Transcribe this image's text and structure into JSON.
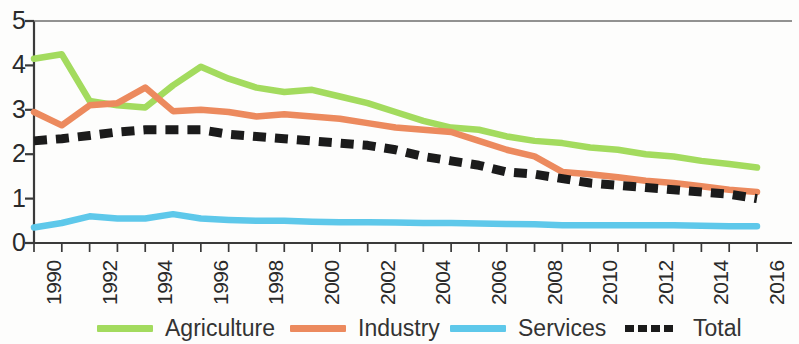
{
  "chart_data": {
    "type": "line",
    "title": "",
    "subtitle": "",
    "xlabel": "",
    "ylabel": "",
    "x": [
      1990,
      1991,
      1992,
      1993,
      1994,
      1995,
      1996,
      1997,
      1998,
      1999,
      2000,
      2001,
      2002,
      2003,
      2004,
      2005,
      2006,
      2007,
      2008,
      2009,
      2010,
      2011,
      2012,
      2013,
      2014,
      2015,
      2016
    ],
    "xlim": [
      1990,
      2016
    ],
    "ylim": [
      0,
      5
    ],
    "y_ticks": [
      "0",
      "1",
      "2",
      "3",
      "4",
      "5"
    ],
    "x_ticks": [
      "1990",
      "1992",
      "1994",
      "1996",
      "1998",
      "2000",
      "2002",
      "2004",
      "2006",
      "2008",
      "2010",
      "2012",
      "2014",
      "2016"
    ],
    "grid": false,
    "legend_position": "bottom",
    "series": [
      {
        "name": "Agriculture",
        "color": "#a3db5e",
        "style": "solid",
        "values": [
          4.15,
          4.25,
          3.2,
          3.1,
          3.05,
          3.55,
          3.97,
          3.7,
          3.5,
          3.4,
          3.45,
          3.3,
          3.15,
          2.95,
          2.75,
          2.6,
          2.55,
          2.4,
          2.3,
          2.25,
          2.15,
          2.1,
          2.0,
          1.95,
          1.85,
          1.78,
          1.7
        ]
      },
      {
        "name": "Industry",
        "color": "#ec8a5e",
        "style": "solid",
        "values": [
          2.95,
          2.65,
          3.1,
          3.15,
          3.5,
          2.97,
          3.0,
          2.95,
          2.85,
          2.9,
          2.85,
          2.8,
          2.7,
          2.6,
          2.55,
          2.5,
          2.3,
          2.1,
          1.95,
          1.6,
          1.55,
          1.48,
          1.4,
          1.35,
          1.28,
          1.2,
          1.15
        ]
      },
      {
        "name": "Services",
        "color": "#5ec8ea",
        "style": "solid",
        "values": [
          0.35,
          0.45,
          0.6,
          0.55,
          0.55,
          0.65,
          0.55,
          0.52,
          0.5,
          0.5,
          0.48,
          0.47,
          0.47,
          0.46,
          0.45,
          0.45,
          0.44,
          0.43,
          0.42,
          0.4,
          0.4,
          0.4,
          0.4,
          0.4,
          0.39,
          0.38,
          0.38
        ]
      },
      {
        "name": "Total",
        "color": "#1b1b1b",
        "style": "dashed",
        "values": [
          2.3,
          2.35,
          2.42,
          2.5,
          2.55,
          2.55,
          2.55,
          2.45,
          2.4,
          2.35,
          2.3,
          2.25,
          2.2,
          2.1,
          1.95,
          1.85,
          1.75,
          1.6,
          1.55,
          1.45,
          1.35,
          1.3,
          1.25,
          1.2,
          1.15,
          1.1,
          1.0
        ]
      }
    ]
  },
  "legend": {
    "items": [
      {
        "label": "Agriculture",
        "color": "#a3db5e",
        "style": "solid"
      },
      {
        "label": "Industry",
        "color": "#ec8a5e",
        "style": "solid"
      },
      {
        "label": "Services",
        "color": "#5ec8ea",
        "style": "solid"
      },
      {
        "label": "Total",
        "color": "#1b1b1b",
        "style": "dashed"
      }
    ]
  },
  "axes": {
    "y_tick_labels": [
      "5",
      "4",
      "3",
      "2",
      "1",
      "0"
    ],
    "x_tick_labels": [
      "1990",
      "1992",
      "1994",
      "1996",
      "1998",
      "2000",
      "2002",
      "2004",
      "2006",
      "2008",
      "2010",
      "2012",
      "2014",
      "2016"
    ]
  }
}
